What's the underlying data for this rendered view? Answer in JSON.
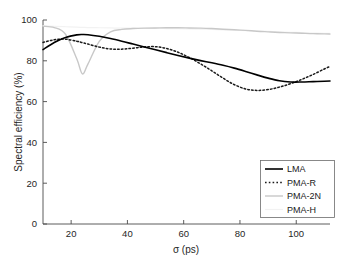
{
  "chart_data": {
    "type": "line",
    "title": "",
    "subtitle": "",
    "xlabel": "σ (ps)",
    "ylabel": "Spectral efficiency (%)",
    "xlim": [
      10,
      112
    ],
    "ylim": [
      0,
      100
    ],
    "xticks": [
      20,
      40,
      60,
      80,
      100
    ],
    "xticklabels": [
      "20",
      "40",
      "60",
      "80",
      "100"
    ],
    "yticks": [
      0,
      20,
      40,
      60,
      80,
      100
    ],
    "yticklabels": [
      "0",
      "20",
      "40",
      "60",
      "80",
      "100"
    ],
    "grid": false,
    "legend_position": "lower right",
    "x": [
      10,
      14,
      18,
      22,
      24,
      26,
      30,
      34,
      38,
      42,
      46,
      50,
      54,
      58,
      62,
      66,
      70,
      74,
      78,
      82,
      86,
      90,
      94,
      98,
      102,
      106,
      110,
      112
    ],
    "series": [
      {
        "name": "LMA",
        "style": "solid",
        "color": "#000000",
        "width": 1.6,
        "values": [
          85.5,
          89.0,
          91.4,
          92.7,
          92.9,
          92.8,
          92.0,
          90.9,
          89.6,
          88.2,
          86.8,
          85.4,
          84.0,
          82.6,
          81.3,
          80.1,
          79.0,
          77.8,
          76.4,
          74.8,
          73.1,
          71.5,
          70.2,
          69.6,
          69.6,
          69.8,
          70.0,
          70.1
        ]
      },
      {
        "name": "PMA-R",
        "style": "dotted",
        "color": "#1a1a1a",
        "width": 1.5,
        "values": [
          89.0,
          90.3,
          90.6,
          89.6,
          88.9,
          88.2,
          86.7,
          85.8,
          85.7,
          86.2,
          86.8,
          86.9,
          86.0,
          84.2,
          81.6,
          78.5,
          75.1,
          71.5,
          68.3,
          66.2,
          65.5,
          65.9,
          67.1,
          68.8,
          70.9,
          73.3,
          76.0,
          77.2
        ]
      },
      {
        "name": "PMA-2N",
        "style": "solid",
        "color": "#c8c8c8",
        "width": 1.4,
        "values": [
          96.9,
          96.3,
          93.0,
          81.0,
          73.6,
          78.5,
          89.5,
          94.2,
          95.4,
          95.8,
          96.0,
          96.1,
          96.2,
          96.2,
          96.1,
          96.0,
          95.8,
          95.5,
          95.2,
          94.9,
          94.5,
          94.2,
          93.9,
          93.7,
          93.5,
          93.3,
          93.2,
          93.1
        ]
      },
      {
        "name": "PMA-H",
        "style": "solid",
        "color": "#f2f2f2",
        "width": 1.2,
        "values": [
          97.2,
          96.9,
          96.7,
          96.5,
          96.4,
          96.3,
          96.2,
          96.1,
          96.0,
          96.0,
          95.9,
          95.9,
          95.8,
          95.7,
          95.6,
          95.5,
          95.4,
          95.2,
          95.0,
          94.8,
          94.6,
          94.4,
          94.2,
          94.0,
          93.8,
          93.6,
          93.5,
          93.4
        ]
      }
    ]
  },
  "legend": {
    "entries": [
      {
        "label": "LMA"
      },
      {
        "label": "PMA-R"
      },
      {
        "label": "PMA-2N"
      },
      {
        "label": "PMA-H"
      }
    ]
  }
}
